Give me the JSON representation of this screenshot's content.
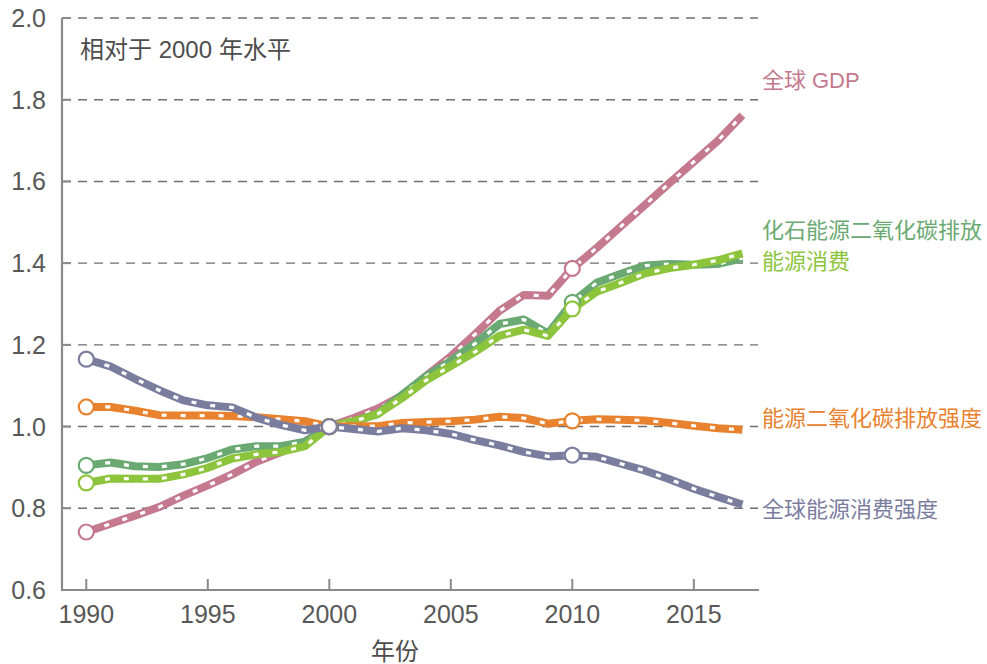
{
  "chart_data": {
    "type": "line",
    "title": "",
    "annotation": "相对于 2000 年水平",
    "xlabel": "年份",
    "ylabel": "",
    "xlim": [
      1989,
      2017.6
    ],
    "ylim": [
      0.6,
      2.0
    ],
    "grid": true,
    "legend_position": "right-inline",
    "xticks": [
      "1990",
      "1995",
      "2000",
      "2005",
      "2010",
      "2015"
    ],
    "xtick_values": [
      1990,
      1995,
      2000,
      2005,
      2010,
      2015
    ],
    "yticks": [
      "0.6",
      "0.8",
      "1.0",
      "1.2",
      "1.4",
      "1.6",
      "1.8",
      "2.0"
    ],
    "ytick_values": [
      0.6,
      0.8,
      1.0,
      1.2,
      1.4,
      1.6,
      1.8,
      2.0
    ],
    "x": [
      1990,
      1991,
      1992,
      1993,
      1994,
      1995,
      1996,
      1997,
      1998,
      1999,
      2000,
      2001,
      2002,
      2003,
      2004,
      2005,
      2006,
      2007,
      2008,
      2009,
      2010,
      2011,
      2012,
      2013,
      2014,
      2015,
      2016,
      2017
    ],
    "decade_markers": [
      1990,
      2000,
      2010
    ],
    "series": [
      {
        "name": "全球 GDP",
        "color": "#c4798e",
        "label_x": 2017.8,
        "label_y": 1.845,
        "values": [
          0.742,
          0.762,
          0.782,
          0.803,
          0.831,
          0.856,
          0.883,
          0.914,
          0.937,
          0.963,
          1.0,
          1.021,
          1.044,
          1.076,
          1.125,
          1.172,
          1.226,
          1.283,
          1.322,
          1.32,
          1.387,
          1.437,
          1.49,
          1.543,
          1.596,
          1.648,
          1.7,
          1.762
        ]
      },
      {
        "name": "化石能源二氧化碳排放",
        "color": "#6aaa72",
        "label_x": 2017.8,
        "label_y": 1.478,
        "values": [
          0.905,
          0.912,
          0.903,
          0.901,
          0.908,
          0.923,
          0.944,
          0.952,
          0.952,
          0.963,
          1.0,
          1.012,
          1.031,
          1.078,
          1.124,
          1.161,
          1.203,
          1.251,
          1.262,
          1.228,
          1.304,
          1.352,
          1.374,
          1.394,
          1.398,
          1.396,
          1.398,
          1.412
        ]
      },
      {
        "name": "能源消费",
        "color": "#8cc43c",
        "label_x": 2017.8,
        "label_y": 1.404,
        "values": [
          0.862,
          0.873,
          0.872,
          0.872,
          0.883,
          0.899,
          0.922,
          0.932,
          0.938,
          0.952,
          1.0,
          1.013,
          1.031,
          1.07,
          1.114,
          1.148,
          1.183,
          1.222,
          1.237,
          1.222,
          1.288,
          1.33,
          1.352,
          1.375,
          1.388,
          1.396,
          1.407,
          1.424
        ]
      },
      {
        "name": "能源二氧化碳排放强度",
        "color": "#e8822e",
        "label_x": 2017.8,
        "label_y": 1.018,
        "values": [
          1.048,
          1.048,
          1.039,
          1.028,
          1.027,
          1.027,
          1.026,
          1.023,
          1.018,
          1.013,
          1.0,
          1.001,
          1.001,
          1.009,
          1.011,
          1.013,
          1.017,
          1.024,
          1.021,
          1.007,
          1.014,
          1.018,
          1.017,
          1.015,
          1.009,
          1.002,
          0.996,
          0.992
        ]
      },
      {
        "name": "全球能源消费强度",
        "color": "#7b7d9e",
        "label_x": 2017.8,
        "label_y": 0.795,
        "values": [
          1.165,
          1.147,
          1.117,
          1.089,
          1.064,
          1.052,
          1.047,
          1.022,
          1.004,
          0.991,
          1.0,
          0.994,
          0.988,
          0.996,
          0.991,
          0.982,
          0.967,
          0.954,
          0.938,
          0.927,
          0.93,
          0.926,
          0.909,
          0.892,
          0.871,
          0.848,
          0.828,
          0.809
        ]
      }
    ]
  }
}
